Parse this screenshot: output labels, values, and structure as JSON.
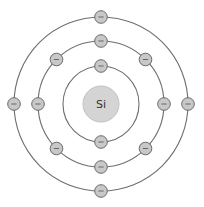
{
  "diagram": {
    "element_symbol": "Si",
    "colors": {
      "background": "#ffffff",
      "orbit": "#6e6e6e",
      "nucleus_fill": "#d4d4d4",
      "nucleus_stroke": "#c2c2c2",
      "electron_fill": "#c8c8c8",
      "electron_stroke": "#6a6a6a",
      "electron_sign": "#666666",
      "label": "#333333"
    },
    "center": [
      101,
      104
    ],
    "nucleus_radius": 18,
    "electron_radius": 6.3,
    "electron_symbol": "−",
    "shells": [
      {
        "name": "shell-1",
        "radius": 38,
        "electron_count": 2,
        "angles": [
          270,
          90
        ]
      },
      {
        "name": "shell-2",
        "radius": 63,
        "electron_count": 8,
        "angles": [
          270,
          315,
          0,
          45,
          90,
          135,
          180,
          225
        ]
      },
      {
        "name": "shell-3",
        "radius": 87,
        "electron_count": 4,
        "angles": [
          270,
          0,
          90,
          180
        ]
      }
    ],
    "total_electrons": 14
  }
}
